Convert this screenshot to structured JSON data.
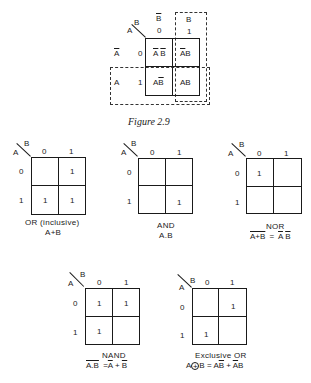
{
  "figure": {
    "caption": "Figure 2.9",
    "top_map": {
      "corner_a": "A",
      "corner_b": "B",
      "col_headers_symbol": [
        "B",
        "B"
      ],
      "col_headers_symbol_overline": [
        true,
        false
      ],
      "col_headers": [
        "0",
        "1"
      ],
      "row_headers_symbol": [
        "A",
        "A"
      ],
      "row_headers_symbol_overline": [
        true,
        false
      ],
      "row_headers": [
        "0",
        "1"
      ],
      "cells": [
        [
          {
            "a": "A",
            "a_bar": true,
            "b": "B",
            "b_bar": true
          },
          {
            "a": "A",
            "a_bar": true,
            "b": "B",
            "b_bar": false
          }
        ],
        [
          {
            "a": "A",
            "a_bar": false,
            "b": "B",
            "b_bar": true
          },
          {
            "a": "A",
            "a_bar": false,
            "b": "B",
            "b_bar": false
          }
        ]
      ],
      "dashed_regions": [
        "A (row 1)",
        "B (column 1)"
      ]
    }
  },
  "maps": [
    {
      "name": "OR (inclusive)",
      "expression": "A+B",
      "corner_a": "A",
      "corner_b": "B",
      "col_headers": [
        "0",
        "1"
      ],
      "row_headers": [
        "0",
        "1"
      ],
      "cells": [
        [
          "",
          "1"
        ],
        [
          "1",
          "1"
        ]
      ]
    },
    {
      "name": "AND",
      "expression": "A.B",
      "corner_a": "A",
      "corner_b": "B",
      "col_headers": [
        "0",
        "1"
      ],
      "row_headers": [
        "0",
        "1"
      ],
      "cells": [
        [
          "",
          ""
        ],
        [
          "",
          "1"
        ]
      ]
    },
    {
      "name": "NOR",
      "expression_lhs": "A+B",
      "expression_eq": "=",
      "expression_rhs_a": "A",
      "expression_rhs_b": "B",
      "corner_a": "A",
      "corner_b": "B",
      "col_headers": [
        "0",
        "1"
      ],
      "row_headers": [
        "0",
        "1"
      ],
      "cells": [
        [
          "1",
          ""
        ],
        [
          "",
          ""
        ]
      ]
    },
    {
      "name": "NAND",
      "expression_lhs": "A.B",
      "expression_eq": "=",
      "expression_rhs_a": "A",
      "expression_rhs_plus": "+",
      "expression_rhs_b": "B",
      "corner_a": "A",
      "corner_b": "B",
      "col_headers": [
        "0",
        "1"
      ],
      "row_headers": [
        "0",
        "1"
      ],
      "cells": [
        [
          "1",
          "1"
        ],
        [
          "1",
          ""
        ]
      ]
    },
    {
      "name": "Exclusive OR",
      "expression_a": "A",
      "expression_op": "+",
      "expression_b": "B",
      "expression_eq": "=",
      "expression_term1": "AB",
      "expression_plus": "+",
      "expression_term2": "AB",
      "corner_a": "A",
      "corner_b": "B",
      "col_headers": [
        "0",
        "1"
      ],
      "row_headers": [
        "0",
        "1"
      ],
      "cells": [
        [
          "",
          "1"
        ],
        [
          "1",
          ""
        ]
      ]
    }
  ]
}
